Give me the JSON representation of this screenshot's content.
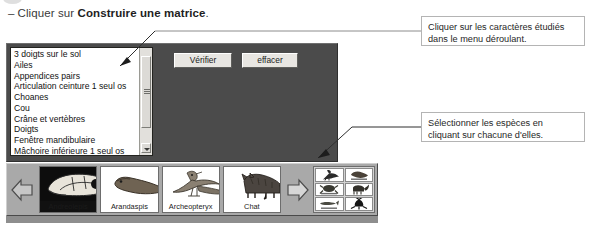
{
  "instruction": {
    "dash": "–",
    "prefix": "Cliquer sur ",
    "bold": "Construire une matrice",
    "suffix": "."
  },
  "app_panel": {
    "criteria_list": {
      "name": "caractères list",
      "items": [
        "3 doigts sur le sol",
        "Ailes",
        "Appendices pairs",
        "Articulation ceinture 1 seul os",
        "Choanes",
        "Cou",
        "Crâne et vertèbres",
        "Doigts",
        "Fenêtre mandibulaire",
        "Mâchoire inférieure 1 seul os"
      ]
    },
    "buttons": {
      "verify_label": "Vérifier",
      "erase_label": "effacer"
    },
    "background_color": "#4b4b4b"
  },
  "species_strip": {
    "prev_arrow_icon": "arrow-left-icon",
    "next_arrow_icon": "arrow-right-icon",
    "cards": [
      {
        "label": "Andreolepis",
        "icon": "fish-skull-icon"
      },
      {
        "label": "Arandaspis",
        "icon": "jawless-fish-icon"
      },
      {
        "label": "Archeopteryx",
        "icon": "archaeopteryx-icon"
      },
      {
        "label": "Chat",
        "icon": "cat-icon"
      }
    ],
    "selected_grid": {
      "icons": [
        "bird-thumb-icon",
        "fish-thumb-icon",
        "amphibian-thumb-icon",
        "mammal-thumb-icon",
        "jawless-thumb-icon",
        "reptile-thumb-icon"
      ]
    }
  },
  "annotations": [
    {
      "id": "callout-dropdown",
      "line1": "Cliquer sur les caractères étudiés",
      "line2": "dans le menu déroulant."
    },
    {
      "id": "callout-select",
      "line1": "Sélectionner les espèces en",
      "line2": "cliquant sur chacune d'elles."
    }
  ]
}
